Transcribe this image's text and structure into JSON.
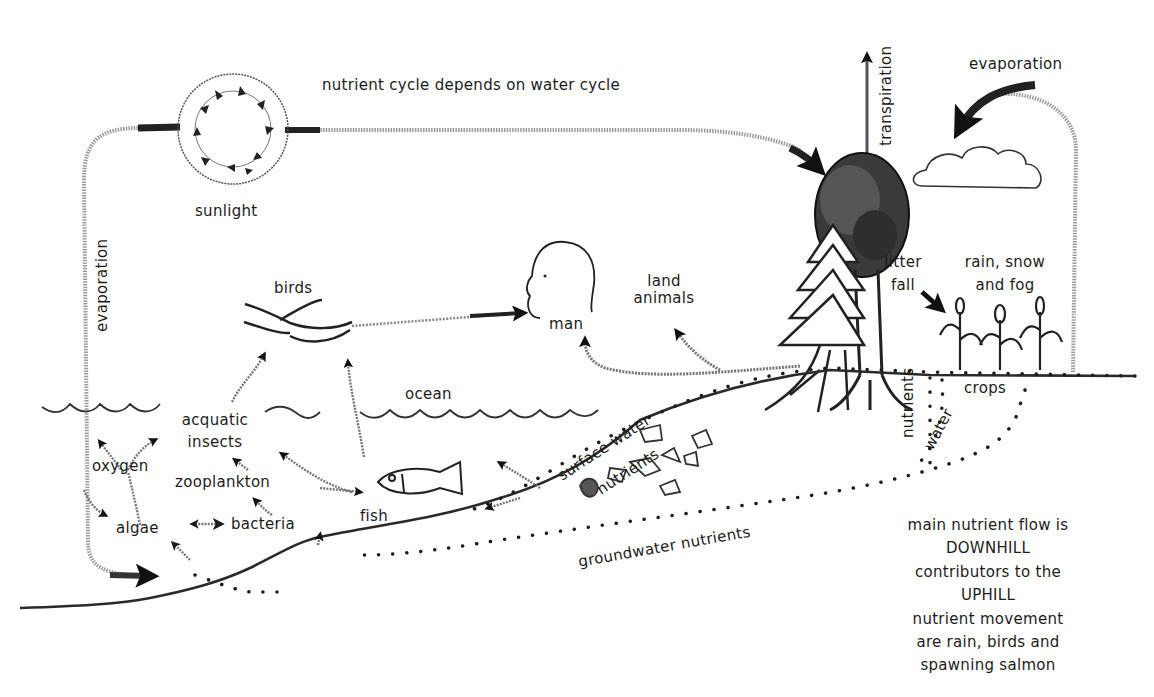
{
  "diagram": {
    "title": "nutrient cycle depends on water cycle",
    "labels": {
      "sunlight": "sunlight",
      "evaporation_left": "evaporation",
      "evaporation_right": "evaporation",
      "transpiration": "transpiration",
      "birds": "birds",
      "man": "man",
      "land_animals_1": "land",
      "land_animals_2": "animals",
      "litter_fall_1": "litter",
      "litter_fall_2": "fall",
      "rain_1": "rain, snow",
      "rain_2": "and fog",
      "ocean": "ocean",
      "acquatic_1": "acquatic",
      "acquatic_2": "insects",
      "oxygen": "oxygen",
      "zooplankton": "zooplankton",
      "algae": "algae",
      "bacteria": "bacteria",
      "fish": "fish",
      "surface_water": "surface water",
      "nutrients_slope": "nutrients",
      "nutrients_vertical": "nutrients",
      "water_vertical": "water",
      "crops": "crops",
      "groundwater": "groundwater nutrients"
    },
    "note_lines": [
      "main nutrient flow is",
      "DOWNHILL",
      "contributors to the",
      "UPHILL",
      "nutrient movement",
      "are rain, birds and",
      "spawning salmon"
    ],
    "nodes": [
      "sunlight",
      "cloud",
      "deciduous tree",
      "conifer tree",
      "crops",
      "man",
      "birds",
      "fish",
      "rocks",
      "ocean surface",
      "ground"
    ],
    "flows": [
      {
        "from": "sunlight",
        "to": "tree",
        "label": "nutrient cycle depends on water cycle"
      },
      {
        "from": "tree",
        "to": "atmosphere",
        "label": "transpiration"
      },
      {
        "from": "ground",
        "to": "cloud",
        "label": "evaporation"
      },
      {
        "from": "ocean",
        "to": "sunlight",
        "label": "evaporation"
      },
      {
        "from": "birds",
        "to": "man"
      },
      {
        "from": "land",
        "to": "man"
      },
      {
        "from": "land",
        "to": "land animals"
      },
      {
        "from": "acquatic insects",
        "to": "birds"
      },
      {
        "from": "fish",
        "to": "birds"
      },
      {
        "from": "zooplankton",
        "to": "fish"
      },
      {
        "from": "algae",
        "to": "bacteria",
        "bidirectional": true
      },
      {
        "from": "surface water",
        "to": "fish"
      },
      {
        "from": "groundwater nutrients",
        "to": "algae"
      }
    ]
  },
  "colors": {
    "ink": "#1c1c1c",
    "stipple": "#8a8a8a",
    "background": "#ffffff"
  }
}
